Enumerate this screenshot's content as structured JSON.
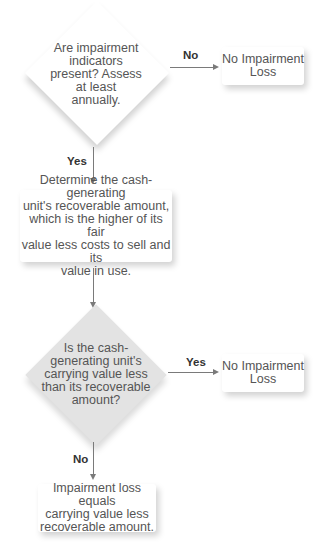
{
  "flowchart": {
    "decision1": {
      "text_lines": [
        "Are impairment",
        "indicators",
        "present? Assess",
        "at least",
        "annually."
      ],
      "no_label": "No",
      "yes_label": "Yes"
    },
    "outcome1": {
      "text_lines": [
        "No Impairment",
        "Loss"
      ]
    },
    "process1": {
      "text_lines": [
        "Determine the cash-generating",
        "unit's recoverable amount,",
        "which is the higher of its fair",
        "value less costs to sell and its",
        "value in use."
      ]
    },
    "decision2": {
      "text_lines": [
        "Is the cash-",
        "generating unit's",
        "carrying value less",
        "than its recoverable",
        "amount?"
      ],
      "yes_label": "Yes",
      "no_label": "No"
    },
    "outcome2": {
      "text_lines": [
        "No Impairment",
        "Loss"
      ]
    },
    "result": {
      "text_lines": [
        "Impairment loss equals",
        "carrying value less",
        "recoverable amount."
      ]
    }
  }
}
